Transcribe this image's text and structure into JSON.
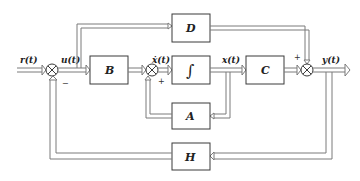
{
  "diagram": {
    "type": "state-space block diagram",
    "blocks": {
      "B": {
        "label": "B"
      },
      "integrator": {
        "label": "∫"
      },
      "C": {
        "label": "C"
      },
      "D": {
        "label": "D"
      },
      "A": {
        "label": "A"
      },
      "H": {
        "label": "H"
      }
    },
    "signals": {
      "input": "r(t)",
      "control": "u(t)",
      "state_derivative": "ẋ(t)",
      "state": "x(t)",
      "output": "y(t)"
    },
    "summing_junctions": {
      "sum1": {
        "feedback_sign": "−"
      },
      "sum2": {
        "feedback_sign": "+"
      },
      "sum3": {
        "feedforward_sign": "+"
      }
    },
    "colors": {
      "block_stroke": "#3a3a3a",
      "signal_stroke": "#7a7a7a",
      "background": "#ffffff"
    }
  }
}
